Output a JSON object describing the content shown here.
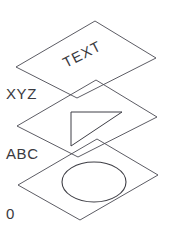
{
  "diagram": {
    "type": "layered-planes-exploded-view",
    "background_color": "#ffffff",
    "line_color": "#4a4a52",
    "text_color": "#3a3a40",
    "layers": [
      {
        "label": "XYZ",
        "label_position": {
          "x": 6,
          "y": 99
        },
        "plane": {
          "name": "top-plane",
          "points": "95,21 156,58 77,98 16,67"
        },
        "content": {
          "kind": "text",
          "value": "TEXT",
          "x": 66,
          "y": 68,
          "rotation": -27
        }
      },
      {
        "label": "ABC",
        "label_position": {
          "x": 6,
          "y": 159
        },
        "plane": {
          "name": "middle-plane",
          "points": "96,80 157,117 78,157 17,126"
        },
        "content": {
          "kind": "triangle",
          "points": "71,112 122,112 71,146"
        }
      },
      {
        "label": "0",
        "label_position": {
          "x": 6,
          "y": 219
        },
        "plane": {
          "name": "bottom-plane",
          "points": "97,139 158,175 80,220 18,185"
        },
        "content": {
          "kind": "ellipse",
          "cx": 94,
          "cy": 182,
          "rx": 32,
          "ry": 20
        }
      }
    ]
  }
}
